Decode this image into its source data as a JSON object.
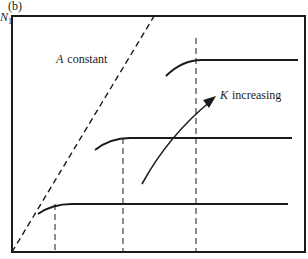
{
  "figure": {
    "panel_label": "(b)",
    "y_axis_label": "N",
    "y_axis_subscript": "1",
    "annotation_a_var": "A",
    "annotation_a_text": "constant",
    "annotation_k_var": "K",
    "annotation_k_text": "increasing"
  },
  "colors": {
    "line": "#1a1a1a",
    "background": "#ffffff"
  },
  "curves": [
    {
      "name": "low-K",
      "plateau_y": 204,
      "breakpoint_x": 55,
      "end_x": 288
    },
    {
      "name": "mid-K",
      "plateau_y": 138,
      "breakpoint_x": 123,
      "end_x": 292
    },
    {
      "name": "high-K",
      "plateau_y": 60,
      "breakpoint_x": 196,
      "end_x": 298
    }
  ]
}
